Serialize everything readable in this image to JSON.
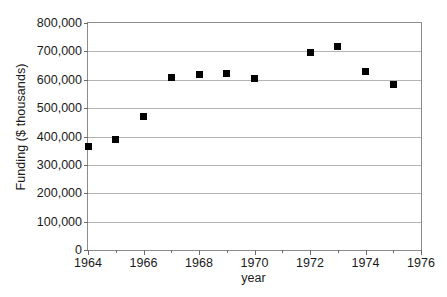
{
  "chart_data": {
    "type": "scatter",
    "title": "",
    "xlabel": "year",
    "ylabel": "Funding ($ thousands)",
    "xlim": [
      1964,
      1976
    ],
    "ylim": [
      0,
      800000
    ],
    "grid": true,
    "legend": false,
    "marker": "filled-square",
    "marker_color": "#000000",
    "gridline_color": "#b3b3b3",
    "border_color": "#8c8c8c",
    "x_major_tick_step": 2,
    "x_minor_tick_step": 1,
    "y_tick_step": 100000,
    "x_tick_labels": [
      "1964",
      "1966",
      "1968",
      "1970",
      "1972",
      "1974",
      "1976"
    ],
    "x_tick_values": [
      1964,
      1966,
      1968,
      1970,
      1972,
      1974,
      1976
    ],
    "x_minor_tick_values": [
      1965,
      1967,
      1969,
      1971,
      1973,
      1975
    ],
    "y_tick_labels": [
      "0",
      "100,000",
      "200,000",
      "300,000",
      "400,000",
      "500,000",
      "600,000",
      "700,000",
      "800,000"
    ],
    "y_tick_values": [
      0,
      100000,
      200000,
      300000,
      400000,
      500000,
      600000,
      700000,
      800000
    ],
    "x": [
      1964,
      1965,
      1966,
      1967,
      1968,
      1969,
      1970,
      1972,
      1973,
      1974,
      1975
    ],
    "values": [
      363000,
      388000,
      472000,
      607000,
      620000,
      622000,
      604000,
      697000,
      717000,
      628000,
      585000
    ],
    "points": [
      {
        "x": 1964,
        "y": 363000
      },
      {
        "x": 1965,
        "y": 388000
      },
      {
        "x": 1966,
        "y": 472000
      },
      {
        "x": 1967,
        "y": 607000
      },
      {
        "x": 1968,
        "y": 620000
      },
      {
        "x": 1969,
        "y": 622000
      },
      {
        "x": 1970,
        "y": 604000
      },
      {
        "x": 1972,
        "y": 697000
      },
      {
        "x": 1973,
        "y": 717000
      },
      {
        "x": 1974,
        "y": 628000
      },
      {
        "x": 1975,
        "y": 585000
      }
    ]
  }
}
